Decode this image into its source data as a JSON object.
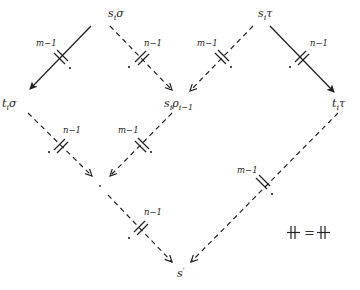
{
  "diagram": {
    "nodes": {
      "si_sigma": {
        "base": "s",
        "sub": "i",
        "rest": "σ"
      },
      "si_tau": {
        "base": "s",
        "sub": "i",
        "rest": "τ"
      },
      "ti_sigma": {
        "base": "t",
        "sub": "i",
        "rest": "σ"
      },
      "si_rho": {
        "base": "s",
        "sub": "i",
        "rest": "ρ",
        "rest_sub": "i−1"
      },
      "ti_tau": {
        "base": "t",
        "sub": "i",
        "rest": "τ"
      },
      "s_prime": {
        "base": "s",
        "sup": "′"
      },
      "center_point": {
        "label": "·"
      }
    },
    "edges": [
      {
        "from": "si_sigma",
        "to": "ti_sigma",
        "style": "solid",
        "label": "m−1"
      },
      {
        "from": "si_sigma",
        "to": "si_rho",
        "style": "dashed",
        "label": "n−1"
      },
      {
        "from": "si_tau",
        "to": "si_rho",
        "style": "dashed",
        "label": "m−1"
      },
      {
        "from": "si_tau",
        "to": "ti_tau",
        "style": "solid",
        "label": "n−1"
      },
      {
        "from": "ti_sigma",
        "to": "center_point",
        "style": "dashed",
        "label": "n−1"
      },
      {
        "from": "si_rho",
        "to": "center_point",
        "style": "dashed",
        "label": "m−1"
      },
      {
        "from": "center_point",
        "to": "s_prime",
        "style": "dashed",
        "label": "n−1"
      },
      {
        "from": "ti_tau",
        "to": "s_prime",
        "style": "dashed",
        "label": "m−1"
      }
    ],
    "legend": {
      "left": "⧺",
      "equals": "=",
      "right": "⧺"
    }
  }
}
